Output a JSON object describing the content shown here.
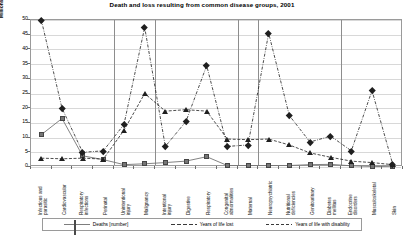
{
  "chart_data": {
    "type": "line",
    "title": "Death and loss resulting from common disease groups, 2001",
    "xlabel": "",
    "ylabel": "Millions",
    "ylim": [
      0,
      50
    ],
    "yticks": [
      0,
      5,
      10,
      15,
      20,
      25,
      30,
      35,
      40,
      45,
      50
    ],
    "grid": true,
    "legend_position": "bottom",
    "categories": [
      "Infectious and parasitic",
      "Cardiovascular",
      "Respiratory infections",
      "Perinatal",
      "Unintentional injury",
      "Malignancy",
      "Intentional injury",
      "Digestive",
      "Respiratory",
      "Congenital abnormalities",
      "Maternal",
      "Neuropsychiatric",
      "Nutritional deficiencies",
      "Genitourinary",
      "Diabetes mellitus",
      "Endocrine disorders",
      "Musculoskeletal",
      "Skin"
    ],
    "series": [
      {
        "name": "Deaths [number]",
        "marker": "square",
        "line": "solid",
        "values": [
          11,
          16.5,
          3.8,
          2.5,
          0.8,
          1.1,
          1.5,
          2.0,
          3.5,
          0.5,
          0.5,
          0.5,
          0.5,
          0.8,
          0.9,
          0.4,
          0.2,
          0.1
        ]
      },
      {
        "name": "Years of life lost",
        "marker": "triangle",
        "line": "dashed",
        "values": [
          3.0,
          2.8,
          3.0,
          2.7,
          12.5,
          25.0,
          19.0,
          19.5,
          19.0,
          9.5,
          9.3,
          9.5,
          7.5,
          4.8,
          3.3,
          2.0,
          1.5,
          0.8
        ]
      },
      {
        "name": "Years of life with disability",
        "marker": "diamond",
        "line": "dash-dot",
        "values": [
          50.0,
          20.0,
          5.0,
          5.5,
          14.5,
          47.5,
          7.0,
          15.5,
          34.5,
          7.0,
          7.5,
          45.5,
          17.5,
          8.5,
          10.5,
          5.5,
          26.0,
          1.0
        ]
      }
    ]
  },
  "legend": {
    "items": [
      {
        "label": "Deaths [number]"
      },
      {
        "label": "Years of life lost"
      },
      {
        "label": "Years of life with disability"
      }
    ]
  },
  "colors": {
    "deaths": "#757575",
    "yll": "#1f1f1f",
    "yld": "#1f1f1f",
    "grid": "#d8d8d8",
    "axis": "#9a9a9a"
  },
  "separators_after_categories": [
    3,
    5,
    9,
    10,
    14
  ]
}
